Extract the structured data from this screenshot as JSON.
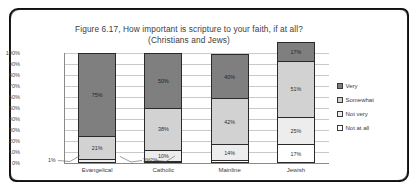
{
  "chart_data": {
    "type": "bar",
    "stacked": true,
    "stack_mode": "percent",
    "title": "Figure 6.17, How important is scripture to your faith, if at all?",
    "subtitle": "(Christians and Jews)",
    "xlabel": "",
    "ylabel": "",
    "ylim": [
      0,
      100
    ],
    "yticks": [
      "0%",
      "10%",
      "20%",
      "30%",
      "40%",
      "50%",
      "60%",
      "70%",
      "80%",
      "90%",
      "100%"
    ],
    "grid": true,
    "legend_position": "right",
    "categories": [
      "Evangelical",
      "Catholic",
      "Mainline",
      "Jewish"
    ],
    "series": [
      {
        "name": "Not at all",
        "color": "#ffffff",
        "values": [
          1,
          2,
          3,
          17
        ],
        "labels": [
          "1%",
          "2%",
          "3%",
          "17%"
        ]
      },
      {
        "name": "Not very",
        "color": "#ededed",
        "values": [
          3,
          10,
          14,
          25
        ],
        "labels": [
          "3%",
          "10%",
          "14%",
          "25%"
        ]
      },
      {
        "name": "Somewhat",
        "color": "#d2d2d2",
        "values": [
          21,
          38,
          42,
          51
        ],
        "labels": [
          "21%",
          "38%",
          "42%",
          "51%"
        ]
      },
      {
        "name": "Very",
        "color": "#7f7f7f",
        "values": [
          75,
          50,
          40,
          17
        ],
        "labels": [
          "75%",
          "50%",
          "40%",
          "17%"
        ]
      }
    ],
    "callouts": [
      {
        "text": "1%"
      },
      {
        "text": "3%"
      },
      {
        "text": "2%"
      }
    ]
  }
}
